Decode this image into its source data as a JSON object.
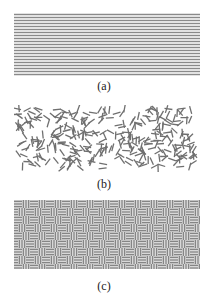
{
  "figure": {
    "panels": [
      {
        "id": "a",
        "label": "(a)",
        "pattern": "horizontal-parallel-lines",
        "line_count": 21,
        "stroke_color": "#8a8a8a",
        "box": {
          "x": 14,
          "y": 13,
          "w": 186,
          "h": 63
        },
        "caption_y": 79
      },
      {
        "id": "b",
        "label": "(b)",
        "pattern": "random-oriented-short-segments",
        "segment_count": 330,
        "segment_length": 8,
        "stroke_color": "#6f6f6f",
        "box": {
          "x": 14,
          "y": 105,
          "w": 184,
          "h": 67
        },
        "caption_y": 177
      },
      {
        "id": "c",
        "label": "(c)",
        "pattern": "basket-weave",
        "cell_size": 8,
        "lines_per_cell": 3,
        "stroke_color": "#7a7a7a",
        "box": {
          "x": 14,
          "y": 200,
          "w": 186,
          "h": 69
        },
        "caption_y": 279
      }
    ]
  }
}
